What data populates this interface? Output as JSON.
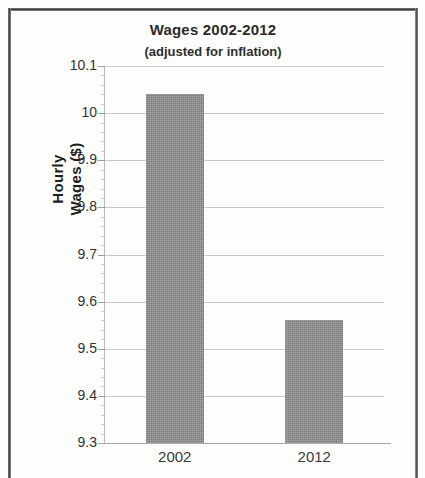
{
  "chart_data": {
    "type": "bar",
    "title": "Wages 2002-2012",
    "subtitle": "(adjusted for inflation)",
    "xlabel": "",
    "ylabel": "Hourly Wages ($)",
    "ylabel_line1": "Hourly",
    "ylabel_line2": "Wages ($)",
    "categories": [
      "2002",
      "2012"
    ],
    "values": [
      10.04,
      9.56
    ],
    "series": [
      {
        "name": "Hourly Wages",
        "values": [
          10.04,
          9.56
        ],
        "color": "#8d8d8d"
      }
    ],
    "ylim": [
      9.3,
      10.1
    ],
    "ytick_step": 0.1,
    "yticks": [
      "10.1",
      "10",
      "9.9",
      "9.8",
      "9.7",
      "9.6",
      "9.5",
      "9.4",
      "9.3"
    ],
    "ytick_values": [
      10.1,
      10,
      9.9,
      9.8,
      9.7,
      9.6,
      9.5,
      9.4,
      9.3
    ],
    "grid": true,
    "minor_ticks": true,
    "legend": false,
    "legend_position": "none",
    "bar_color": "#8d8d8d",
    "gridline_color": "#c9c9c9"
  }
}
